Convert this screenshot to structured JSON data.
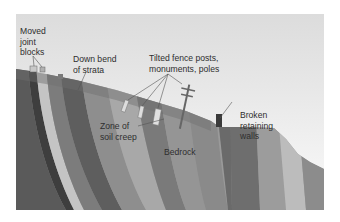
{
  "diagram": {
    "labels": {
      "moved_joint_blocks": "Moved\njoint\nblocks",
      "down_bend_of_strata": "Down bend\nof strata",
      "tilted_objects": "Tilted fence posts,\nmonuments, poles",
      "zone_of_soil_creep": "Zone of\nsoil creep",
      "bedrock": "Bedrock",
      "broken_retaining_walls": "Broken\nretaining\nwalls"
    },
    "colors": {
      "sky_top": "#dcdcdc",
      "sky_bottom": "#f6f6f6",
      "strata_dark": "#4a4a4a",
      "strata_mid": "#8a8a8a",
      "strata_light": "#b8b8b8",
      "text": "#2e2e2e",
      "leader_line": "#555555"
    }
  }
}
